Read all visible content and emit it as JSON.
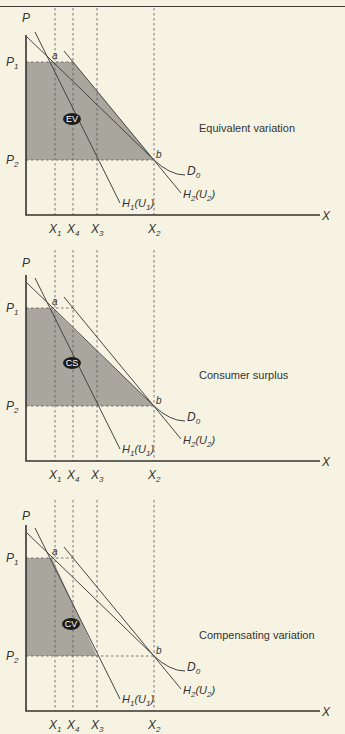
{
  "colors": {
    "background": "#f7f3e3",
    "shade": "#a9a69e",
    "line": "#444444",
    "badge": "#1d1d1d"
  },
  "axes": {
    "y_label": "P",
    "x_label": "X",
    "price_levels": [
      {
        "label": "P",
        "sub": "1",
        "y": 62
      },
      {
        "label": "P",
        "sub": "2",
        "y": 160
      }
    ],
    "quantity_levels": [
      {
        "label": "X",
        "sub": "1",
        "x": 55
      },
      {
        "label": "X",
        "sub": "4",
        "x": 73
      },
      {
        "label": "X",
        "sub": "3",
        "x": 97
      },
      {
        "label": "X",
        "sub": "2",
        "x": 154
      }
    ]
  },
  "curves": {
    "d0": {
      "label": "D",
      "sub": "0"
    },
    "h1": {
      "label": "H",
      "sub": "1",
      "arg": "U",
      "arg_sub": "1"
    },
    "h2": {
      "label": "H",
      "sub": "2",
      "arg": "U",
      "arg_sub": "2"
    }
  },
  "points": {
    "a": "a",
    "b": "b"
  },
  "panels": [
    {
      "id": "ev",
      "badge": "EV",
      "caption": "Equivalent variation",
      "offset_y": 0,
      "shaded_under": "H2"
    },
    {
      "id": "cs",
      "badge": "CS",
      "caption": "Consumer surplus",
      "offset_y": 246,
      "shaded_under": "D0"
    },
    {
      "id": "cv",
      "badge": "CV",
      "caption": "Compensating variation",
      "offset_y": 496,
      "shaded_under": "H1"
    }
  ]
}
